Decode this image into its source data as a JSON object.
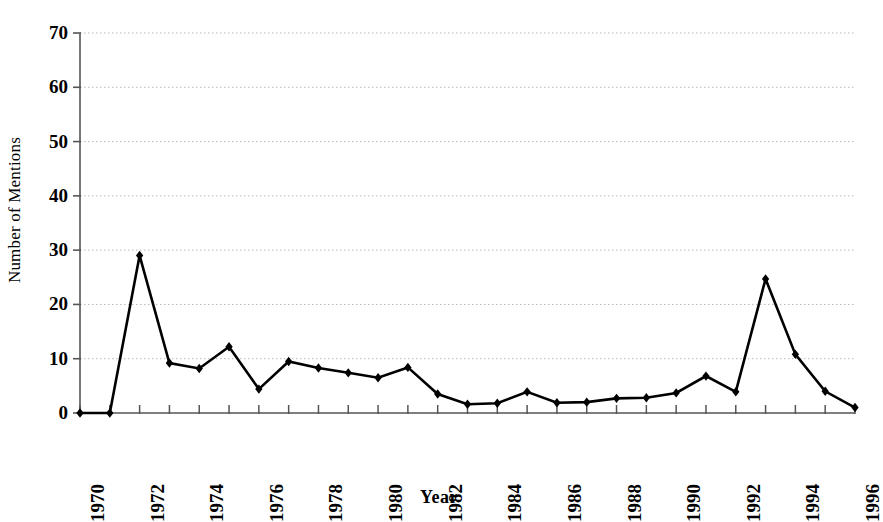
{
  "chart_data": {
    "type": "line",
    "title": "",
    "xlabel": "Year",
    "ylabel": "Number of Mentions",
    "xlim": [
      1970,
      1996
    ],
    "ylim": [
      0,
      70
    ],
    "ytick_labels": [
      "70",
      "60",
      "50",
      "40",
      "30",
      "20",
      "10",
      "0"
    ],
    "ytick_values": [
      70,
      60,
      50,
      40,
      30,
      20,
      10,
      0
    ],
    "ytick_step": 10,
    "xtick_labels": [
      "1970",
      "1972",
      "1974",
      "1976",
      "1978",
      "1980",
      "1982",
      "1984",
      "1986",
      "1988",
      "1990",
      "1992",
      "1994",
      "1996"
    ],
    "xtick_label_values": [
      1970,
      1972,
      1974,
      1976,
      1978,
      1980,
      1982,
      1984,
      1986,
      1988,
      1990,
      1992,
      1994,
      1996
    ],
    "xtick_label_rotation": -90,
    "x": [
      1970,
      1971,
      1972,
      1973,
      1974,
      1975,
      1976,
      1977,
      1978,
      1979,
      1980,
      1981,
      1982,
      1983,
      1984,
      1985,
      1986,
      1987,
      1988,
      1989,
      1990,
      1991,
      1992,
      1993,
      1994,
      1995,
      1996
    ],
    "values": [
      0,
      0,
      29,
      9.2,
      8.2,
      12.2,
      4.4,
      9.5,
      8.3,
      7.4,
      6.5,
      8.4,
      3.5,
      1.6,
      1.8,
      3.9,
      1.9,
      2.0,
      2.7,
      2.8,
      3.7,
      6.8,
      3.9,
      24.7,
      10.8,
      4.0,
      1.0
    ],
    "series": [
      {
        "name": "Number of Mentions",
        "values": [
          0,
          0,
          29,
          9.2,
          8.2,
          12.2,
          4.4,
          9.5,
          8.3,
          7.4,
          6.5,
          8.4,
          3.5,
          1.6,
          1.8,
          3.9,
          1.9,
          2.0,
          2.7,
          2.8,
          3.7,
          6.8,
          3.9,
          24.7,
          10.8,
          4.0,
          1.0
        ]
      }
    ],
    "grid": true,
    "grid_axis": "y",
    "grid_style": "dotted",
    "grid_color": "#b8b8b8",
    "legend": "none",
    "line_color": "#000000",
    "line_width": 2.6,
    "marker": "diamond",
    "marker_color": "#000000",
    "marker_size": 7,
    "axis_color": "#555555",
    "annotations": [
      {
        "label": "peak",
        "x": 1972,
        "y": 29
      },
      {
        "label": "peak",
        "x": 1993,
        "y": 24.7
      }
    ]
  }
}
